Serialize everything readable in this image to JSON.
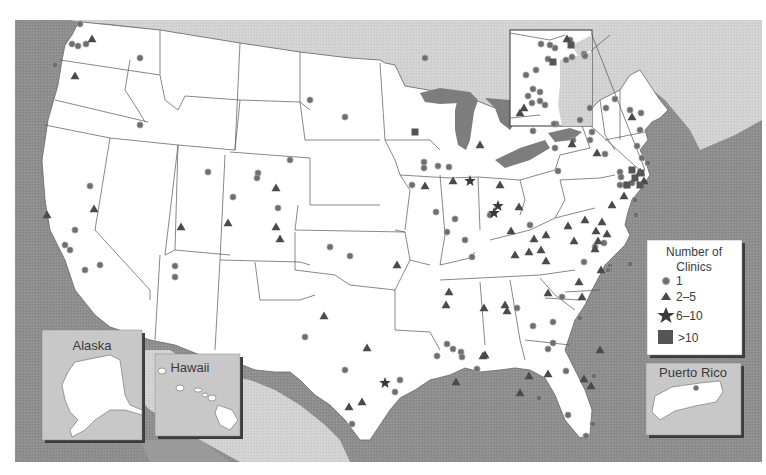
{
  "colors": {
    "ocean": "#8e8e8e",
    "foreign_land": "#d4d4d4",
    "mexico_land": "#cfcfcf",
    "us_land": "#ffffff",
    "great_lakes": "#7d7d7d",
    "state_border": "#555555",
    "marker": "#6e6e6e",
    "marker_stroke": "#9a9a9a",
    "inset_bg": "#c8c8c8",
    "inset_shadow": "#3c3c3c"
  },
  "legend": {
    "title_line1": "Number of",
    "title_line2": "Clinics",
    "items": [
      {
        "symbol": "circle",
        "label": "1"
      },
      {
        "symbol": "triangle",
        "label": "2–5"
      },
      {
        "symbol": "star",
        "label": "6–10"
      },
      {
        "symbol": "square",
        "label": ">10"
      }
    ]
  },
  "insets": {
    "alaska": {
      "title": "Alaska"
    },
    "hawaii": {
      "title": "Hawaii"
    },
    "puerto_rico": {
      "title": "Puerto Rico"
    },
    "northeast_zoom": {
      "title": ""
    }
  },
  "markers": {
    "circles": [
      [
        80,
        24
      ],
      [
        72,
        44
      ],
      [
        78,
        46
      ],
      [
        86,
        44
      ],
      [
        55,
        65
      ],
      [
        140,
        58
      ],
      [
        140,
        125
      ],
      [
        90,
        186
      ],
      [
        75,
        230
      ],
      [
        65,
        245
      ],
      [
        70,
        250
      ],
      [
        85,
        270
      ],
      [
        100,
        265
      ],
      [
        175,
        266
      ],
      [
        175,
        277
      ],
      [
        208,
        172
      ],
      [
        233,
        197
      ],
      [
        258,
        173
      ],
      [
        257,
        178
      ],
      [
        290,
        160
      ],
      [
        330,
        247
      ],
      [
        350,
        256
      ],
      [
        278,
        208
      ],
      [
        305,
        337
      ],
      [
        345,
        370
      ],
      [
        425,
        58
      ],
      [
        310,
        100
      ],
      [
        345,
        117
      ],
      [
        424,
        162
      ],
      [
        424,
        168
      ],
      [
        412,
        185
      ],
      [
        438,
        166
      ],
      [
        449,
        167
      ],
      [
        436,
        212
      ],
      [
        447,
        232
      ],
      [
        455,
        219
      ],
      [
        472,
        257
      ],
      [
        465,
        240
      ],
      [
        490,
        215
      ],
      [
        530,
        225
      ],
      [
        533,
        131
      ],
      [
        555,
        148
      ],
      [
        558,
        171
      ],
      [
        573,
        140
      ],
      [
        592,
        132
      ],
      [
        590,
        140
      ],
      [
        605,
        154
      ],
      [
        620,
        172
      ],
      [
        620,
        185
      ],
      [
        626,
        185
      ],
      [
        635,
        200
      ],
      [
        636,
        215
      ],
      [
        604,
        243
      ],
      [
        595,
        247
      ],
      [
        584,
        262
      ],
      [
        610,
        266
      ],
      [
        610,
        270
      ],
      [
        630,
        264
      ],
      [
        621,
        177
      ],
      [
        632,
        183
      ],
      [
        608,
        270
      ],
      [
        562,
        297
      ],
      [
        517,
        308
      ],
      [
        553,
        322
      ],
      [
        580,
        318
      ],
      [
        553,
        343
      ],
      [
        594,
        376
      ],
      [
        548,
        349
      ],
      [
        533,
        326
      ],
      [
        539,
        398
      ],
      [
        568,
        415
      ],
      [
        586,
        436
      ],
      [
        593,
        424
      ],
      [
        566,
        371
      ],
      [
        637,
        146
      ],
      [
        642,
        158
      ],
      [
        648,
        163
      ],
      [
        640,
        130
      ],
      [
        630,
        110
      ],
      [
        641,
        113
      ],
      [
        615,
        99
      ],
      [
        606,
        108
      ],
      [
        590,
        108
      ],
      [
        453,
        349
      ],
      [
        437,
        356
      ],
      [
        461,
        352
      ],
      [
        462,
        357
      ],
      [
        477,
        369
      ],
      [
        400,
        380
      ],
      [
        395,
        392
      ],
      [
        352,
        424
      ],
      [
        447,
        344
      ]
    ],
    "triangles": [
      [
        92,
        39
      ],
      [
        75,
        76
      ],
      [
        47,
        215
      ],
      [
        94,
        209
      ],
      [
        181,
        227
      ],
      [
        228,
        223
      ],
      [
        276,
        188
      ],
      [
        276,
        227
      ],
      [
        280,
        239
      ],
      [
        324,
        316
      ],
      [
        397,
        265
      ],
      [
        362,
        402
      ],
      [
        349,
        407
      ],
      [
        367,
        348
      ],
      [
        449,
        292
      ],
      [
        446,
        305
      ],
      [
        484,
        308
      ],
      [
        505,
        305
      ],
      [
        515,
        255
      ],
      [
        529,
        252
      ],
      [
        541,
        250
      ],
      [
        574,
        241
      ],
      [
        568,
        226
      ],
      [
        585,
        220
      ],
      [
        595,
        249
      ],
      [
        579,
        282
      ],
      [
        582,
        297
      ],
      [
        598,
        241
      ],
      [
        601,
        270
      ],
      [
        600,
        350
      ],
      [
        584,
        379
      ],
      [
        591,
        386
      ],
      [
        548,
        374
      ],
      [
        485,
        355
      ],
      [
        456,
        382
      ],
      [
        529,
        376
      ],
      [
        520,
        393
      ],
      [
        612,
        205
      ],
      [
        624,
        196
      ],
      [
        644,
        181
      ],
      [
        640,
        172
      ],
      [
        425,
        186
      ],
      [
        453,
        181
      ],
      [
        572,
        144
      ],
      [
        480,
        145
      ],
      [
        524,
        108
      ],
      [
        597,
        153
      ],
      [
        632,
        117
      ],
      [
        602,
        222
      ],
      [
        534,
        239
      ],
      [
        507,
        311
      ],
      [
        483,
        356
      ],
      [
        548,
        293
      ],
      [
        511,
        231
      ],
      [
        546,
        235
      ],
      [
        546,
        261
      ],
      [
        596,
        231
      ],
      [
        607,
        234
      ],
      [
        519,
        207
      ],
      [
        500,
        185
      ]
    ],
    "stars": [
      [
        494,
        213
      ],
      [
        498,
        206
      ],
      [
        385,
        383
      ],
      [
        470,
        181
      ]
    ],
    "squares": [
      [
        635,
        178
      ],
      [
        641,
        173
      ],
      [
        632,
        170
      ],
      [
        415,
        132
      ],
      [
        627,
        185
      ],
      [
        640,
        185
      ],
      [
        571,
        45
      ]
    ]
  },
  "inset_zoom_markers": {
    "circles": [
      [
        541,
        44
      ],
      [
        555,
        48
      ],
      [
        548,
        59
      ],
      [
        536,
        70
      ],
      [
        526,
        75
      ],
      [
        533,
        89
      ],
      [
        540,
        92
      ],
      [
        528,
        96
      ],
      [
        566,
        60
      ],
      [
        572,
        57
      ],
      [
        584,
        54
      ],
      [
        585,
        56
      ],
      [
        550,
        45
      ],
      [
        570,
        40
      ],
      [
        556,
        124
      ],
      [
        554,
        124
      ],
      [
        540,
        101
      ],
      [
        545,
        105
      ],
      [
        532,
        103
      ],
      [
        580,
        120
      ]
    ],
    "triangles": [
      [
        567,
        39
      ],
      [
        520,
        113
      ]
    ],
    "squares": [
      [
        553,
        62
      ]
    ]
  }
}
